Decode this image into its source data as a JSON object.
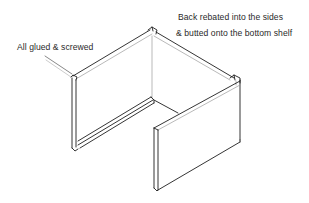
{
  "diagram": {
    "stroke_color": "#1e1e1e",
    "light_stroke_color": "#8a8a8a",
    "background": "#ffffff",
    "annotations": [
      {
        "id": "glued",
        "text": "All glued & screwed"
      },
      {
        "id": "back_line1",
        "text": "Back rebated into the sides"
      },
      {
        "id": "back_line2",
        "text": "& butted onto the bottom shelf"
      }
    ],
    "parts": [
      "left-side-panel",
      "back-panel",
      "bottom-shelf-rebate",
      "right-side-panel",
      "front-right-panel"
    ]
  }
}
